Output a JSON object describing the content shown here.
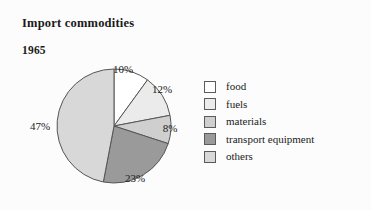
{
  "chart_data": {
    "type": "pie",
    "title": "Import commodities",
    "subtitle": "1965",
    "categories": [
      "food",
      "fuels",
      "materials",
      "transport equipment",
      "others"
    ],
    "values": [
      10,
      12,
      8,
      23,
      47
    ],
    "value_labels": [
      "10%",
      "12%",
      "8%",
      "23%",
      "47%"
    ],
    "colors": [
      "#ffffff",
      "#ebebeb",
      "#cfcfcf",
      "#9a9a9a",
      "#d8d8d8"
    ],
    "start_angle_deg": 0,
    "direction": "clockwise",
    "legend_position": "right",
    "grid": false,
    "xlabel": "",
    "ylabel": ""
  },
  "figure": {
    "title": "Import commodities",
    "year": "1965",
    "background_color": "#fcfcfc",
    "outline_color": "#555555"
  },
  "legend": {
    "items": [
      {
        "label": "food",
        "color": "#ffffff"
      },
      {
        "label": "fuels",
        "color": "#ebebeb"
      },
      {
        "label": "materials",
        "color": "#cfcfcf"
      },
      {
        "label": "transport equipment",
        "color": "#9a9a9a"
      },
      {
        "label": "others",
        "color": "#d8d8d8"
      }
    ]
  },
  "slice_labels": [
    {
      "text": "10%",
      "x": 123,
      "y": 69
    },
    {
      "text": "12%",
      "x": 162,
      "y": 89
    },
    {
      "text": "8%",
      "x": 170,
      "y": 128
    },
    {
      "text": "23%",
      "x": 135,
      "y": 178
    },
    {
      "text": "47%",
      "x": 40,
      "y": 126
    }
  ]
}
